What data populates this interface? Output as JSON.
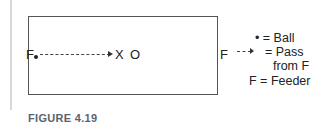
{
  "diagram": {
    "left_player": "F",
    "right_player": "F",
    "target_marker": "X",
    "opponent_marker": "O"
  },
  "legend": {
    "ball": "• = Ball",
    "pass_line1": "= Pass",
    "pass_line2": "from F",
    "feeder": "F = Feeder"
  },
  "caption": "FIGURE 4.19"
}
